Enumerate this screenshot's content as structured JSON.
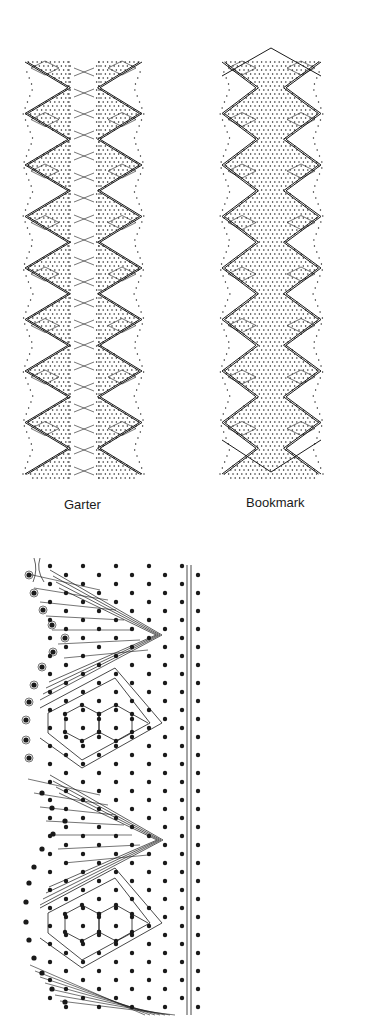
{
  "figures": [
    {
      "id": "garter",
      "label": "Garter",
      "type": "lace-pricking-overview",
      "zigzag_count": 8,
      "has_center_crossings": true
    },
    {
      "id": "bookmark",
      "label": "Bookmark",
      "type": "lace-pricking-overview",
      "zigzag_count": 8,
      "has_center_crossings": false
    }
  ],
  "detail": {
    "id": "working-diagram",
    "type": "bobbin-lace-working-diagram",
    "repeats": 2
  },
  "colors": {
    "ink": "#1a1a1a",
    "paper": "#ffffff"
  }
}
